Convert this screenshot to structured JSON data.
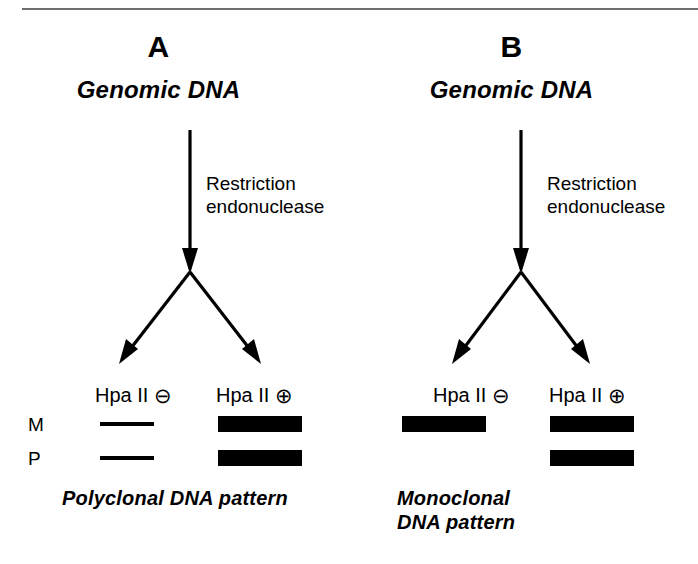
{
  "figure": {
    "background": "#ffffff",
    "ink_color": "#000000",
    "rule_color": "#6e6e6e"
  },
  "panels": [
    {
      "letter": "A",
      "title": "Genomic DNA",
      "enzyme_label": "Restriction\nendonuclease",
      "lanes": [
        {
          "label": "Hpa II",
          "sign": "⊖",
          "sign_name": "circled-minus"
        },
        {
          "label": "Hpa II",
          "sign": "⊕",
          "sign_name": "circled-plus"
        }
      ],
      "row_labels": [
        "M",
        "P"
      ],
      "bands": [
        {
          "row": "M",
          "lane": "Hpa II ⊖",
          "style": "thin",
          "x": 100,
          "y": 422,
          "width": 54
        },
        {
          "row": "P",
          "lane": "Hpa II ⊖",
          "style": "thin",
          "x": 100,
          "y": 456,
          "width": 54
        },
        {
          "row": "M",
          "lane": "Hpa II ⊕",
          "style": "thick",
          "x": 218,
          "y": 416,
          "width": 84
        },
        {
          "row": "P",
          "lane": "Hpa II ⊕",
          "style": "thick",
          "x": 218,
          "y": 450,
          "width": 84
        }
      ],
      "pattern_caption": "Polyclonal DNA pattern"
    },
    {
      "letter": "B",
      "title": "Genomic DNA",
      "enzyme_label": "Restriction\nendonuclease",
      "lanes": [
        {
          "label": "Hpa II",
          "sign": "⊖",
          "sign_name": "circled-minus"
        },
        {
          "label": "Hpa II",
          "sign": "⊕",
          "sign_name": "circled-plus"
        }
      ],
      "row_labels": [
        "M",
        "P"
      ],
      "bands": [
        {
          "row": "M",
          "lane": "Hpa II ⊖",
          "style": "thick",
          "x": 53,
          "y": 416,
          "width": 84
        },
        {
          "row": "M",
          "lane": "Hpa II ⊕",
          "style": "thick",
          "x": 201,
          "y": 416,
          "width": 84
        },
        {
          "row": "P",
          "lane": "Hpa II ⊕",
          "style": "thick",
          "x": 201,
          "y": 450,
          "width": 84
        }
      ],
      "pattern_caption": "Monoclonal\nDNA pattern"
    }
  ]
}
